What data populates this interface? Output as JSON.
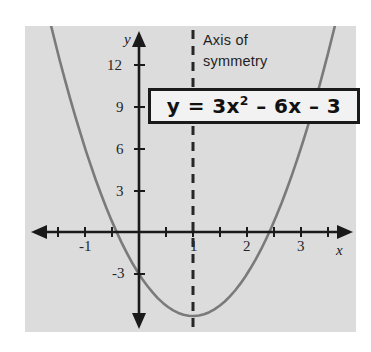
{
  "figure": {
    "kind": "coordinate-graph",
    "panel_color": "#dcdcdc",
    "background_color": "#ffffff"
  },
  "annotation": {
    "line1": "Axis of",
    "line2": "symmetry",
    "full_text": "Axis of symmetry"
  },
  "equation": {
    "lhs": "y",
    "equals": "=",
    "term1_coefficient": "3",
    "term1_variable": "x",
    "term1_exponent": "2",
    "term2": "– 6x",
    "term3": "– 3",
    "display": "y = 3x² – 6x – 3"
  },
  "axes": {
    "x_label": "x",
    "y_label": "y",
    "x_tick_labels": [
      "-1",
      "1",
      "2",
      "3"
    ],
    "y_tick_labels": [
      "12",
      "9",
      "6",
      "3",
      "-3"
    ],
    "axis_color": "#1a1a1a"
  },
  "chart_data": {
    "type": "line",
    "title": "",
    "subtitle": "",
    "xlabel": "x",
    "ylabel": "y",
    "xlim": [
      -1.85,
      3.8
    ],
    "ylim": [
      -7.3,
      14.5
    ],
    "grid": false,
    "legend": null,
    "x_ticks_major": [
      -1,
      1,
      2,
      3
    ],
    "x_ticks_minor_step": 0.5,
    "y_ticks_major": [
      12,
      9,
      6,
      3,
      -3
    ],
    "y_ticks_minor_step": 3,
    "series": [
      {
        "name": "y = 3x^2 - 6x - 3",
        "type": "parabola",
        "color": "#7a7a7a",
        "equation": "y = 3x^2 - 6x - 3",
        "a": 3,
        "b": -6,
        "c": -3,
        "vertex": [
          1,
          -6
        ],
        "y_intercept": -3,
        "x_intercepts": [
          -0.414,
          2.414
        ],
        "x": [
          -1.8,
          -1.6,
          -1.4,
          -1.2,
          -1.0,
          -0.8,
          -0.6,
          -0.4,
          -0.2,
          0.0,
          0.2,
          0.4,
          0.6,
          0.8,
          1.0,
          1.2,
          1.4,
          1.6,
          1.8,
          2.0,
          2.2,
          2.4,
          2.6,
          2.8,
          3.0,
          3.2
        ],
        "values": [
          17.52,
          14.28,
          11.28,
          8.52,
          6.0,
          3.72,
          1.68,
          -0.12,
          -1.68,
          -3.0,
          -4.08,
          -4.92,
          -5.52,
          -5.88,
          -6.0,
          -5.88,
          -5.52,
          -4.92,
          -4.08,
          -3.0,
          -1.68,
          -0.12,
          1.68,
          3.72,
          6.0,
          8.52
        ]
      }
    ],
    "annotations": [
      {
        "name": "axis-of-symmetry",
        "type": "vline",
        "x": 1,
        "style": "dashed",
        "color": "#262626",
        "label": "Axis of symmetry"
      },
      {
        "name": "equation-label",
        "type": "box-label",
        "text": "y = 3x² – 6x – 3"
      }
    ]
  }
}
